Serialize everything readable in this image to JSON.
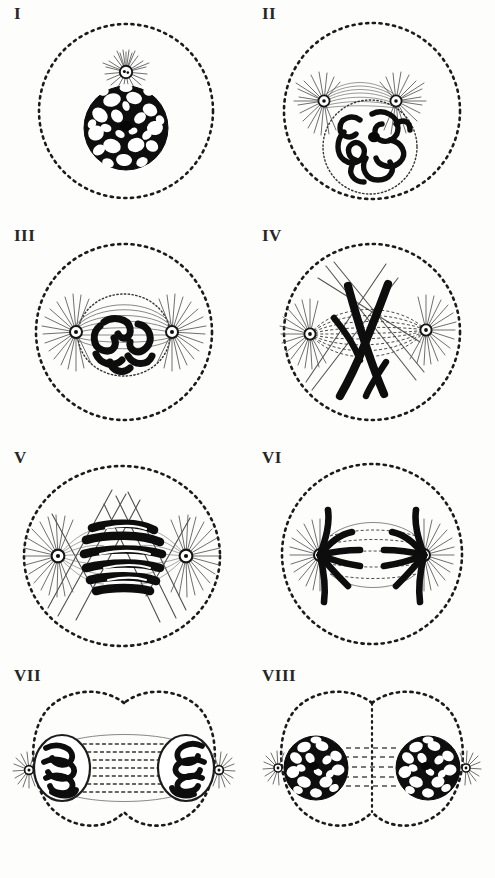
{
  "plate": {
    "title": "Stages of Mitosis (Karyokinesis)",
    "description": "Eight-panel engraved plate showing successive stages of animal cell division, drawn in black ink on white paper.",
    "ink_color": "#111111",
    "paper_color": "#fdfdfc",
    "rows": 4,
    "columns": 2
  },
  "panels": [
    {
      "label": "I",
      "stage": "resting cell / early prophase",
      "cell_outline": "dotted-circle",
      "nucleus": "reticulated-network",
      "aster_count": 1,
      "aster_position": "above-nucleus",
      "chromosome_count": 0,
      "caption": "Resting nucleus with reticulum and single attraction sphere"
    },
    {
      "label": "II",
      "stage": "prophase, spireme",
      "cell_outline": "dotted-circle",
      "nucleus": "spireme-thread",
      "aster_count": 2,
      "aster_position": "above-nucleus-paired",
      "chromosome_count": 0,
      "caption": "Centrosome divided; two asters with central spindle over spireme"
    },
    {
      "label": "III",
      "stage": "late prophase",
      "cell_outline": "dotted-circle",
      "nucleus": "thick-chromatin-coils",
      "aster_count": 2,
      "aster_position": "opposite-poles",
      "chromosome_count": 0,
      "caption": "Asters at opposite poles, nuclear membrane fading"
    },
    {
      "label": "IV",
      "stage": "prometaphase",
      "cell_outline": "dotted-circle",
      "nucleus": "none",
      "aster_count": 2,
      "aster_position": "opposite-poles",
      "chromosome_count": 2,
      "caption": "V-shaped chromosomes entering the spindle"
    },
    {
      "label": "V",
      "stage": "metaphase",
      "cell_outline": "dotted-ellipse",
      "nucleus": "none",
      "aster_count": 2,
      "aster_position": "opposite-poles",
      "chromosome_count": 6,
      "caption": "Chromosomes massed at the equatorial plate"
    },
    {
      "label": "VI",
      "stage": "anaphase",
      "cell_outline": "dotted-circle",
      "nucleus": "none",
      "aster_count": 2,
      "aster_position": "opposite-poles",
      "chromosome_count": 8,
      "caption": "Daughter chromosomes travelling to the poles"
    },
    {
      "label": "VII",
      "stage": "telophase",
      "cell_outline": "dotted-bilobed",
      "nucleus": "two-daughter-coils",
      "aster_count": 2,
      "aster_position": "outside-daughter-nuclei",
      "chromosome_count": 0,
      "caption": "Daughter nuclei reforming, interzonal fibres stretched"
    },
    {
      "label": "VIII",
      "stage": "cytokinesis / two daughter cells",
      "cell_outline": "dotted-bilobed-divided",
      "nucleus": "two-reticulated-networks",
      "aster_count": 2,
      "aster_position": "outside-daughter-nuclei",
      "chromosome_count": 0,
      "caption": "Two complete daughter cells with resting reticular nuclei"
    }
  ]
}
